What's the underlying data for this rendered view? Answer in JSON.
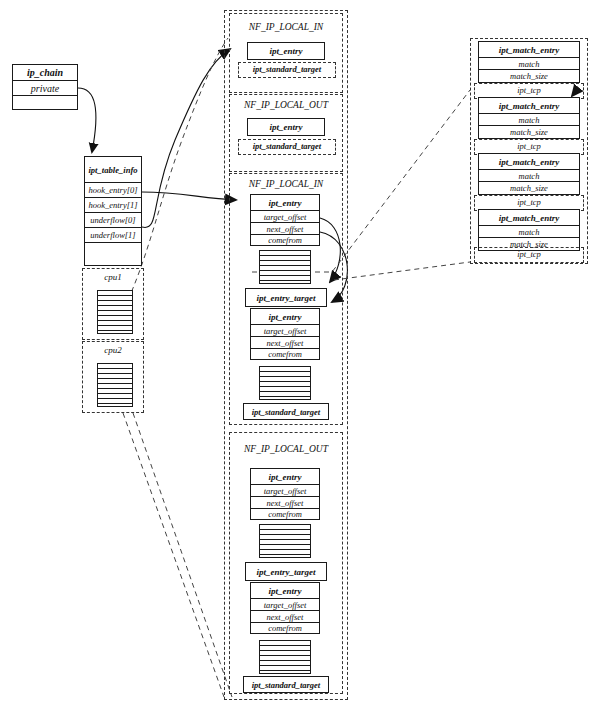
{
  "diagram": {
    "ip_chain": {
      "name": "ip_chain",
      "rows": [
        "ip_chain",
        "private",
        ""
      ]
    },
    "ipt_table_info": {
      "name": "ipt_table_info",
      "rows": [
        "ipt_table_info",
        "hook_entry[0]",
        "hook_entry[1]",
        "underflow[0]",
        "underflow[1]",
        ""
      ]
    },
    "cpu_groups": [
      {
        "label": "cpu1",
        "stripes": 8
      },
      {
        "label": "cpu2",
        "stripes": 8
      }
    ],
    "hook_groups": [
      {
        "label": "NF_IP_LOCAL_IN",
        "kind": "compact",
        "entries": [
          {
            "type": "ipt_entry",
            "rows": [
              "ipt_entry"
            ]
          }
        ],
        "standard_target": "ipt_standard_target"
      },
      {
        "label": "NF_IP_LOCAL_OUT",
        "kind": "compact",
        "entries": [
          {
            "type": "ipt_entry",
            "rows": [
              "ipt_entry"
            ]
          }
        ],
        "standard_target": "ipt_standard_target"
      },
      {
        "label": "NF_IP_LOCAL_IN",
        "kind": "full",
        "entries": [
          {
            "type": "ipt_entry",
            "rows": [
              "ipt_entry",
              "target_offset",
              "next_offset",
              "comefrom"
            ]
          },
          {
            "type": "stripes",
            "stripes": 7
          },
          {
            "type": "ipt_entry_target",
            "rows": [
              "ipt_entry_target"
            ]
          },
          {
            "type": "ipt_entry",
            "rows": [
              "ipt_entry",
              "target_offset",
              "next_offset",
              "comefrom"
            ]
          },
          {
            "type": "stripes",
            "stripes": 7
          }
        ],
        "standard_target": "ipt_standard_target"
      },
      {
        "label": "NF_IP_LOCAL_OUT",
        "kind": "full",
        "entries": [
          {
            "type": "ipt_entry",
            "rows": [
              "ipt_entry",
              "target_offset",
              "next_offset",
              "comefrom"
            ]
          },
          {
            "type": "stripes",
            "stripes": 7
          },
          {
            "type": "ipt_entry_target",
            "rows": [
              "ipt_entry_target"
            ]
          },
          {
            "type": "ipt_entry",
            "rows": [
              "ipt_entry",
              "target_offset",
              "next_offset",
              "comefrom"
            ]
          },
          {
            "type": "stripes",
            "stripes": 7
          }
        ],
        "standard_target": "ipt_standard_target"
      }
    ],
    "match_entries": [
      {
        "rows": [
          "ipt_match_entry",
          "match",
          "match_size"
        ],
        "tcp": "ipt_tcp"
      },
      {
        "rows": [
          "ipt_match_entry",
          "match",
          "match_size"
        ],
        "tcp": "ipt_tcp"
      },
      {
        "rows": [
          "ipt_match_entry",
          "match",
          "match_size"
        ],
        "tcp": "ipt_tcp"
      },
      {
        "rows": [
          "ipt_match_entry",
          "match",
          "match_size"
        ],
        "tcp": "ipt_tcp"
      }
    ],
    "labels": {
      "ip_chain_title": "ip_chain",
      "ip_chain_private": "private",
      "ipt_table_info_title": "ipt_table_info",
      "hook_entry_0": "hook_entry[0]",
      "hook_entry_1": "hook_entry[1]",
      "underflow_0": "underflow[0]",
      "underflow_1": "underflow[1]",
      "cpu1": "cpu1",
      "cpu2": "cpu2",
      "nf_ip_local_in": "NF_IP_LOCAL_IN",
      "nf_ip_local_out": "NF_IP_LOCAL_OUT",
      "ipt_entry": "ipt_entry",
      "ipt_entry_target": "ipt_entry_target",
      "ipt_standard_target": "ipt_standard_target",
      "target_offset": "target_offset",
      "next_offset": "next_offset",
      "comefrom": "comefrom",
      "ipt_match_entry": "ipt_match_entry",
      "match": "match",
      "match_size": "match_size",
      "ipt_tcp": "ipt_tcp"
    },
    "colors": {
      "stroke": "#1a1a1a",
      "dash": "#333333",
      "background": "#ffffff"
    }
  }
}
